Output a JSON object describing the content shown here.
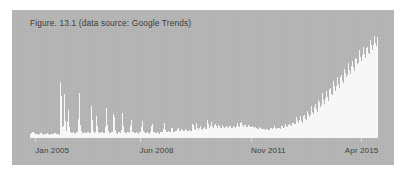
{
  "figure": {
    "caption": "Figure. 13.1 (data source: Google Trends)",
    "panel_color": "#b5b5b5",
    "page_background": "#ffffff",
    "series_fill_color": "#f7f7f7",
    "caption_color": "#3c3c3c",
    "axis_label_color": "#414141",
    "tick_mark_color": "#d8d8d8"
  },
  "chart_data": {
    "type": "area",
    "title": "Figure. 13.1 (data source: Google Trends)",
    "subtitle": "",
    "xlabel": "",
    "ylabel": "",
    "grid": false,
    "legend": "none",
    "source": "Google Trends",
    "x_axis": {
      "type": "time",
      "start": "Jan 2005",
      "end": "Apr 2015",
      "tick_labels": [
        "Jan 2005",
        "Jun 2008",
        "Nov 2011",
        "Apr 2015"
      ],
      "tick_positions_pct": [
        1.5,
        31.5,
        63.5,
        95.0
      ]
    },
    "y_axis": {
      "min": 0,
      "max": 100,
      "tick_labels": [],
      "visible": false
    },
    "series": [
      {
        "name": "Search interest",
        "fill": "#f7f7f7",
        "values": [
          3,
          4,
          6,
          5,
          4,
          3,
          4,
          3,
          4,
          5,
          4,
          3,
          4,
          3,
          5,
          4,
          3,
          4,
          3,
          4,
          5,
          4,
          3,
          4,
          3,
          70,
          12,
          6,
          42,
          8,
          5,
          30,
          10,
          5,
          4,
          6,
          5,
          4,
          6,
          5,
          46,
          9,
          5,
          4,
          6,
          5,
          4,
          6,
          5,
          4,
          34,
          8,
          5,
          4,
          22,
          7,
          5,
          4,
          6,
          5,
          4,
          6,
          28,
          8,
          5,
          4,
          6,
          5,
          30,
          9,
          5,
          4,
          6,
          5,
          4,
          24,
          7,
          5,
          4,
          6,
          5,
          4,
          20,
          6,
          5,
          4,
          6,
          5,
          4,
          6,
          5,
          18,
          6,
          5,
          4,
          6,
          5,
          4,
          6,
          16,
          6,
          5,
          4,
          6,
          5,
          4,
          6,
          5,
          7,
          14,
          6,
          5,
          7,
          6,
          5,
          12,
          6,
          5,
          7,
          6,
          10,
          7,
          6,
          9,
          7,
          6,
          8,
          7,
          6,
          8,
          7,
          6,
          16,
          9,
          7,
          14,
          8,
          7,
          12,
          8,
          7,
          11,
          9,
          8,
          18,
          10,
          9,
          15,
          10,
          9,
          14,
          11,
          9,
          13,
          10,
          9,
          12,
          10,
          9,
          11,
          10,
          9,
          12,
          10,
          9,
          11,
          10,
          9,
          14,
          11,
          10,
          16,
          12,
          10,
          13,
          11,
          10,
          12,
          11,
          10,
          11,
          10,
          9,
          10,
          9,
          8,
          10,
          9,
          8,
          9,
          8,
          7,
          9,
          8,
          7,
          10,
          9,
          8,
          11,
          9,
          8,
          10,
          9,
          8,
          12,
          10,
          9,
          13,
          11,
          10,
          14,
          12,
          11,
          15,
          13,
          12,
          20,
          15,
          13,
          22,
          16,
          14,
          24,
          18,
          16,
          26,
          20,
          18,
          30,
          24,
          21,
          34,
          27,
          24,
          38,
          30,
          27,
          42,
          34,
          30,
          46,
          38,
          34,
          50,
          42,
          38,
          54,
          46,
          42,
          58,
          50,
          46,
          62,
          54,
          50,
          66,
          58,
          54,
          70,
          62,
          58,
          74,
          66,
          62,
          78,
          70,
          66,
          82,
          74,
          70,
          86,
          78,
          74,
          88,
          80,
          76,
          92,
          84,
          80,
          96,
          88,
          84,
          100
        ]
      }
    ],
    "annotations": []
  }
}
